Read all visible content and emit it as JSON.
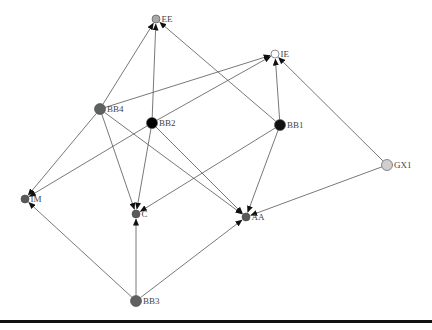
{
  "diagram": {
    "type": "directed-graph",
    "nodes": [
      {
        "id": "EE",
        "label": "EE",
        "x": 156,
        "y": 19,
        "r": 4,
        "fill": "#a8a8a8"
      },
      {
        "id": "IE",
        "label": "IE",
        "x": 275,
        "y": 54,
        "r": 4,
        "fill": "#ffffff"
      },
      {
        "id": "BB4",
        "label": "BB4",
        "x": 100,
        "y": 109,
        "r": 5.5,
        "fill": "#606060"
      },
      {
        "id": "BB2",
        "label": "BB2",
        "x": 152,
        "y": 123,
        "r": 5.5,
        "fill": "#000000"
      },
      {
        "id": "BB1",
        "label": "BB1",
        "x": 280,
        "y": 125,
        "r": 5.5,
        "fill": "#111111"
      },
      {
        "id": "GX1",
        "label": "GX1",
        "x": 387,
        "y": 165,
        "r": 5.5,
        "fill": "#cfcfcf"
      },
      {
        "id": "IM",
        "label": "IM",
        "x": 25,
        "y": 199,
        "r": 4,
        "fill": "#5a5a5a"
      },
      {
        "id": "C",
        "label": "C",
        "x": 136,
        "y": 214,
        "r": 4,
        "fill": "#5a5a5a"
      },
      {
        "id": "AA",
        "label": "AA",
        "x": 246,
        "y": 217,
        "r": 4,
        "fill": "#5a5a5a"
      },
      {
        "id": "BB3",
        "label": "BB3",
        "x": 136,
        "y": 301,
        "r": 5.5,
        "fill": "#606060"
      }
    ],
    "edges": [
      {
        "from": "BB4",
        "to": "EE"
      },
      {
        "from": "BB4",
        "to": "IE"
      },
      {
        "from": "BB4",
        "to": "IM"
      },
      {
        "from": "BB4",
        "to": "C"
      },
      {
        "from": "BB4",
        "to": "AA"
      },
      {
        "from": "BB2",
        "to": "EE"
      },
      {
        "from": "BB2",
        "to": "IE"
      },
      {
        "from": "BB2",
        "to": "IM"
      },
      {
        "from": "BB2",
        "to": "C"
      },
      {
        "from": "BB2",
        "to": "AA"
      },
      {
        "from": "BB1",
        "to": "EE"
      },
      {
        "from": "BB1",
        "to": "IE"
      },
      {
        "from": "BB1",
        "to": "C"
      },
      {
        "from": "BB1",
        "to": "AA"
      },
      {
        "from": "GX1",
        "to": "IE"
      },
      {
        "from": "GX1",
        "to": "AA"
      },
      {
        "from": "BB3",
        "to": "IM"
      },
      {
        "from": "BB3",
        "to": "C"
      },
      {
        "from": "BB3",
        "to": "AA"
      }
    ]
  },
  "footer": {
    "rule_color": "#111111"
  }
}
